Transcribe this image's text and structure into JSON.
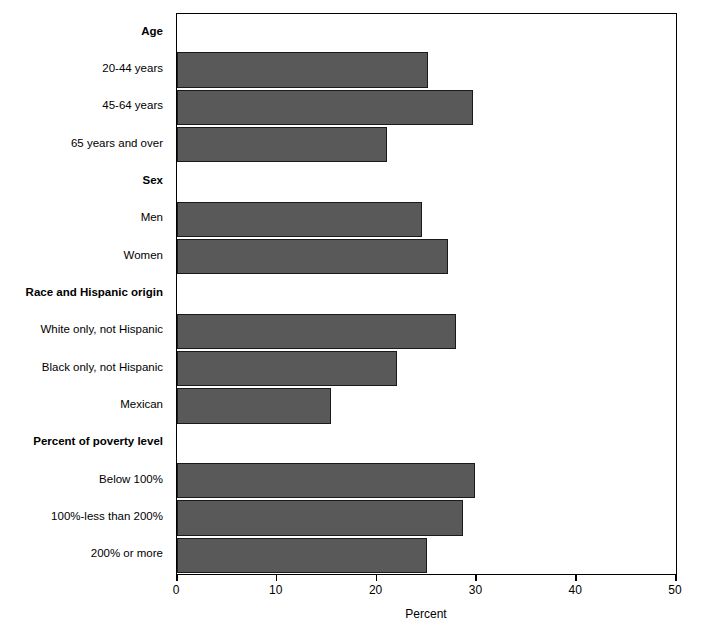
{
  "chart_data": {
    "type": "bar",
    "orientation": "horizontal",
    "title": "",
    "xlabel": "Percent",
    "ylabel": "",
    "xlim": [
      0,
      50
    ],
    "xticks": [
      0,
      10,
      20,
      30,
      40,
      50
    ],
    "xticklabels": [
      "0",
      "10",
      "20",
      "30",
      "40",
      "50"
    ],
    "grid": false,
    "legend": false,
    "bar_color": "#595959",
    "bar_edge_color": "#1a1a1a",
    "axis_color": "#000000",
    "groups": [
      {
        "name": "Age",
        "categories": [
          "20-44 years",
          "45-64 years",
          "65 years and over"
        ],
        "values": [
          25.2,
          29.7,
          21.0
        ]
      },
      {
        "name": "Sex",
        "categories": [
          "Men",
          "Women"
        ],
        "values": [
          24.5,
          27.2
        ]
      },
      {
        "name": "Race and Hispanic origin",
        "categories": [
          "White only, not Hispanic",
          "Black only, not Hispanic",
          "Mexican"
        ],
        "values": [
          28.0,
          22.0,
          15.4
        ]
      },
      {
        "name": "Percent of poverty level",
        "categories": [
          "Below 100%",
          "100%-less than 200%",
          "200% or more"
        ],
        "values": [
          29.9,
          28.7,
          25.1
        ]
      }
    ],
    "categories": [
      "20-44 years",
      "45-64 years",
      "65 years and over",
      "Men",
      "Women",
      "White only, not Hispanic",
      "Black only, not Hispanic",
      "Mexican",
      "Below 100%",
      "100%-less than 200%",
      "200% or more"
    ],
    "values": [
      25.2,
      29.7,
      21.0,
      24.5,
      27.2,
      28.0,
      22.0,
      15.4,
      29.9,
      28.7,
      25.1
    ]
  },
  "rows": [
    {
      "label": "Age",
      "type": "group"
    },
    {
      "label": "20-44 years",
      "type": "bar",
      "value": 25.2
    },
    {
      "label": "45-64 years",
      "type": "bar",
      "value": 29.7
    },
    {
      "label": "65 years and over",
      "type": "bar",
      "value": 21.0
    },
    {
      "label": "Sex",
      "type": "group"
    },
    {
      "label": "Men",
      "type": "bar",
      "value": 24.5
    },
    {
      "label": "Women",
      "type": "bar",
      "value": 27.2
    },
    {
      "label": "Race and Hispanic origin",
      "type": "group"
    },
    {
      "label": "White only, not Hispanic",
      "type": "bar",
      "value": 28.0
    },
    {
      "label": "Black only, not Hispanic",
      "type": "bar",
      "value": 22.0
    },
    {
      "label": "Mexican",
      "type": "bar",
      "value": 15.4
    },
    {
      "label": "Percent of poverty level",
      "type": "group"
    },
    {
      "label": "Below 100%",
      "type": "bar",
      "value": 29.9
    },
    {
      "label": "100%-less than 200%",
      "type": "bar",
      "value": 28.7
    },
    {
      "label": "200% or more",
      "type": "bar",
      "value": 25.1
    }
  ]
}
